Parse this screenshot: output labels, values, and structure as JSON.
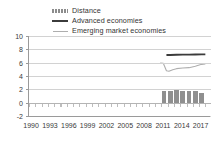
{
  "chart_data": {
    "type": "line",
    "title": "",
    "subtitle": "",
    "xlabel": "",
    "ylabel": "",
    "xlim": [
      1989.5,
      2018.5
    ],
    "ylim": [
      -2,
      10
    ],
    "yticks": [
      10,
      8,
      6,
      4,
      2,
      0,
      -2
    ],
    "xticks": [
      1990,
      1993,
      1996,
      1999,
      2002,
      2005,
      2008,
      2011,
      2014,
      2017
    ],
    "grid": true,
    "legend_position": "top-center",
    "legend": [
      {
        "label": "Distance",
        "marker": "bar",
        "color": "#8f8f8f"
      },
      {
        "label": "Advanced economies",
        "marker": "line",
        "color": "#3b3b3b"
      },
      {
        "label": "Emerging market economies",
        "marker": "line",
        "color": "#aeaeae"
      }
    ],
    "series": [
      {
        "name": "Distance",
        "type": "bar",
        "color": "#8f8f8f",
        "x": [
          2011,
          2012,
          2013,
          2014,
          2015,
          2016,
          2017
        ],
        "values": [
          1.75,
          1.8,
          1.85,
          1.75,
          1.8,
          1.7,
          1.5
        ]
      },
      {
        "name": "Advanced economies",
        "type": "line",
        "color": "#3b3b3b",
        "x": [
          2011.4,
          2012,
          2013,
          2014,
          2015,
          2016,
          2017,
          2017.6
        ],
        "values": [
          7.15,
          7.15,
          7.18,
          7.2,
          7.2,
          7.22,
          7.25,
          7.25
        ]
      },
      {
        "name": "Emerging market economies",
        "type": "line",
        "color": "#aeaeae",
        "x": [
          2010.4,
          2010.9,
          2011.4,
          2011.8,
          2012.4,
          2013,
          2014,
          2015,
          2016,
          2017,
          2017.6
        ],
        "values": [
          5.95,
          5.9,
          4.78,
          4.72,
          4.95,
          5.1,
          5.2,
          5.25,
          5.45,
          5.75,
          5.8
        ]
      }
    ]
  }
}
